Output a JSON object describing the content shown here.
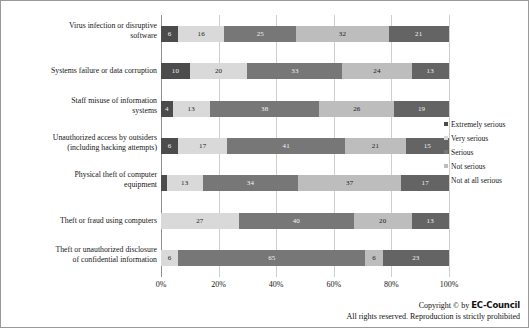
{
  "chart_data": {
    "type": "bar",
    "subtype": "100% stacked horizontal bar",
    "title": "",
    "xlabel": "",
    "ylabel": "",
    "xlim": [
      0,
      100
    ],
    "xticks": [
      "0%",
      "20%",
      "40%",
      "60%",
      "80%",
      "100%"
    ],
    "xtick_values": [
      0,
      20,
      40,
      60,
      80,
      100
    ],
    "grid": true,
    "legend_position": "right",
    "categories": [
      "Virus infection or disruptive software",
      "Systems failure or data corruption",
      "Staff misuse of information systems",
      "Unauthorized access by outsiders (including hacking attempts)",
      "Physical theft of computer equipment",
      "Theft or fraud using computers",
      "Theft or unauthorized disclosure of confidential information"
    ],
    "series": [
      {
        "name": "Extremely serious",
        "color": "#4c4c4c",
        "values": [
          6,
          10,
          4,
          6,
          2,
          0,
          0
        ]
      },
      {
        "name": "Very serious",
        "color": "#d9d9d9",
        "values": [
          16,
          20,
          13,
          17,
          13,
          27,
          6
        ]
      },
      {
        "name": "Serious",
        "color": "#777777",
        "values": [
          25,
          33,
          38,
          41,
          34,
          40,
          65
        ]
      },
      {
        "name": "Not serious",
        "color": "#bdbdbd",
        "values": [
          32,
          24,
          26,
          21,
          37,
          20,
          6
        ]
      },
      {
        "name": "Not at all serious",
        "color": "#646464",
        "values": [
          21,
          13,
          19,
          15,
          17,
          13,
          23
        ]
      }
    ],
    "value_labels": {
      "hidden_when_small": true
    }
  },
  "category_labels": [
    {
      "line1": "Virus infection or disruptive",
      "line2": "software"
    },
    {
      "line1": "Systems failure or data corruption",
      "line2": ""
    },
    {
      "line1": "Staff misuse of information",
      "line2": "systems"
    },
    {
      "line1": "Unauthorized access by outsiders",
      "line2": "(including hacking attempts)"
    },
    {
      "line1": "Physical theft of computer",
      "line2": "equipment"
    },
    {
      "line1": "Theft or fraud using computers",
      "line2": ""
    },
    {
      "line1": "Theft or unauthorized disclosure",
      "line2": "of confidential information"
    }
  ],
  "footer": {
    "copyright_prefix": "Copyright © by ",
    "brand": "EC-Council",
    "rights": "All rights reserved. Reproduction is strictly prohibited"
  }
}
